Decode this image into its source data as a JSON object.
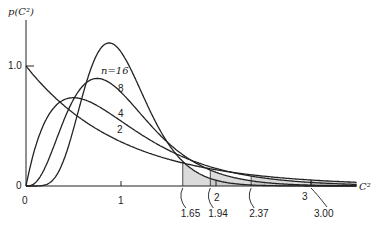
{
  "chart_data": {
    "type": "line",
    "title": "",
    "xlabel": "C²",
    "ylabel": "p(C²)",
    "xlim": [
      0,
      3.5
    ],
    "ylim": [
      0,
      1.3
    ],
    "x_ticks": [
      "0",
      "1",
      "2",
      "3"
    ],
    "y_ticks": [
      "0",
      "1.0"
    ],
    "grid": false,
    "legend": "inline labels on curves",
    "curve_label_prefix": "n = ",
    "series": [
      {
        "name": "n=2",
        "df": 2,
        "label": "2",
        "peak": {
          "x": 0.0,
          "y": 1.0
        }
      },
      {
        "name": "n=4",
        "df": 4,
        "label": "4",
        "peak": {
          "x": 0.5,
          "y": 0.74
        }
      },
      {
        "name": "n=8",
        "df": 8,
        "label": "8",
        "peak": {
          "x": 0.75,
          "y": 0.89
        }
      },
      {
        "name": "n=16",
        "df": 16,
        "label": "n=16",
        "peak": {
          "x": 0.88,
          "y": 1.27
        }
      }
    ],
    "critical_values": [
      {
        "df": 16,
        "value": "1.65",
        "x": 1.65
      },
      {
        "df": 8,
        "value": "1.94",
        "x": 1.94
      },
      {
        "df": 4,
        "value": "2.37",
        "x": 2.37
      },
      {
        "df": 2,
        "value": "3.00",
        "x": 3.0
      }
    ],
    "annotations": [
      "Shaded upper-tail areas beyond critical values 1.65, 1.94, 2.37, 3.00"
    ]
  }
}
